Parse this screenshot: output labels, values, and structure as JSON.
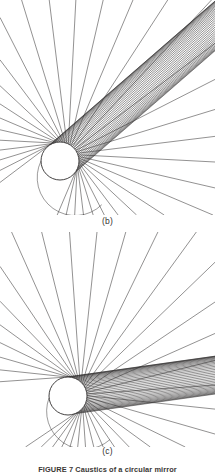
{
  "figure": {
    "background_color": "#ffffff",
    "ink_color": "#2f2d2c",
    "caption_text": "FIGURE 7  Caustics of a circular mirror",
    "caption_visible": "partially cropped at bottom edge"
  },
  "panels": [
    {
      "id": "b",
      "label": "(b)",
      "circle": {
        "cx": 60,
        "cy": 161,
        "r": 19,
        "fill": "#ffffff",
        "stroke": "#2f2d2c",
        "stroke_width": 0.9
      },
      "description": "Parallel rays reflecting from a circular mirror forming an upper fan, a left cusped caustic and a lower crossing-ray caustic",
      "rays": {
        "count": 34,
        "color": "#2f2d2c",
        "width": 0.55,
        "incoming_angle_deg": 41,
        "fan_upper_extent": {
          "x": 60,
          "y": 8
        },
        "fan_right_extent": {
          "x": 210,
          "y": 160
        }
      },
      "caustic_curves": [
        {
          "name": "left-cusp-caustic",
          "kind": "nephroid-cusp"
        },
        {
          "name": "lower-caustic-envelope",
          "kind": "crossing-ray-envelope"
        },
        {
          "name": "horizontal-chord",
          "kind": "line"
        }
      ]
    },
    {
      "id": "c",
      "label": "(c)",
      "circle": {
        "cx": 68,
        "cy": 396,
        "r": 19,
        "fill": "#ffffff",
        "stroke": "#2f2d2c",
        "stroke_width": 0.9
      },
      "description": "Near-normal incidence rays on a circular mirror producing a smooth left envelope, a dark cusp at the right of the circle and a lower crossing-ray caustic",
      "rays": {
        "count": 34,
        "color": "#2f2d2c",
        "width": 0.55,
        "incoming_angle_deg": 8,
        "fan_upper_extent": {
          "x": 72,
          "y": 238
        },
        "fan_right_extent": {
          "x": 210,
          "y": 390
        }
      },
      "caustic_curves": [
        {
          "name": "left-envelope-curve",
          "kind": "smooth-envelope"
        },
        {
          "name": "dark-cusp",
          "kind": "cusp-wedge"
        },
        {
          "name": "lower-caustic-envelope",
          "kind": "crossing-ray-envelope"
        },
        {
          "name": "bottom-arc",
          "kind": "arc"
        }
      ]
    }
  ],
  "chart_data": {
    "type": "line",
    "title": "Caustics of a circular mirror",
    "xlabel": "",
    "ylabel": "",
    "subplots": [
      {
        "label": "(b)",
        "mirror": {
          "shape": "circle",
          "center": [
            0,
            0
          ],
          "radius": 1.0
        },
        "incident_direction_deg": 221,
        "ray_parameters_deg": [
          -88,
          -83,
          -78,
          -73,
          -68,
          -63,
          -58,
          -53,
          -48,
          -43,
          -38,
          -33,
          -28,
          -23,
          -18,
          -13,
          -8,
          -3,
          2,
          7,
          12,
          17,
          22,
          27,
          32,
          37,
          42,
          47,
          52,
          57,
          62,
          67,
          72,
          77
        ],
        "caustic_type": "nephroid",
        "cusp_count": 2,
        "notes": "oblique parallel illumination; reflected rays form a two-lobed caustic with a pronounced cusp left of the circle"
      },
      {
        "label": "(c)",
        "mirror": {
          "shape": "circle",
          "center": [
            0,
            0
          ],
          "radius": 1.0
        },
        "incident_direction_deg": 188,
        "ray_parameters_deg": [
          -88,
          -83,
          -78,
          -73,
          -68,
          -63,
          -58,
          -53,
          -48,
          -43,
          -38,
          -33,
          -28,
          -23,
          -18,
          -13,
          -8,
          -3,
          2,
          7,
          12,
          17,
          22,
          27,
          32,
          37,
          42,
          47,
          52,
          57,
          62,
          67,
          72,
          77
        ],
        "caustic_type": "nephroid",
        "cusp_count": 2,
        "notes": "near axial illumination; the caustic cusp collapses onto the circle producing the dark wedge at the right"
      }
    ],
    "grid": false,
    "legend": "none"
  }
}
